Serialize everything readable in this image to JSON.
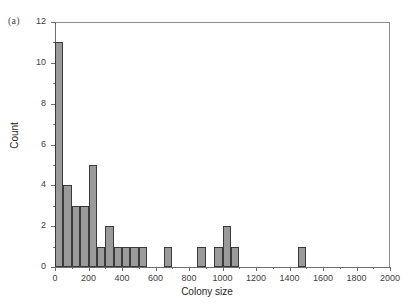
{
  "figure": {
    "panel_label": "(a)"
  },
  "chart_data": {
    "type": "bar",
    "title": "",
    "subtitle": "",
    "xlabel": "Colony size",
    "ylabel": "Count",
    "xlim": [
      0,
      2000
    ],
    "ylim": [
      0,
      12
    ],
    "bin_width": 50,
    "grid": false,
    "legend": null,
    "bar_color": "#9a9a9a",
    "bar_edge_color": "#3a3a3a",
    "x_major_ticks": [
      0,
      200,
      400,
      600,
      800,
      1000,
      1200,
      1400,
      1600,
      1800,
      2000
    ],
    "x_minor_ticks": [
      100,
      300,
      500,
      700,
      900,
      1100,
      1300,
      1500,
      1700,
      1900
    ],
    "x_tick_labels": [
      "0",
      "200",
      "400",
      "600",
      "800",
      "1000",
      "1200",
      "1400",
      "1600",
      "1800",
      "2000"
    ],
    "y_major_ticks": [
      0,
      2,
      4,
      6,
      8,
      10,
      12
    ],
    "y_minor_ticks": [
      1,
      3,
      5,
      7,
      9,
      11
    ],
    "y_tick_labels": [
      "0",
      "2",
      "4",
      "6",
      "8",
      "10",
      "12"
    ],
    "bins": [
      {
        "x0": 0,
        "x1": 50,
        "count": 11
      },
      {
        "x0": 50,
        "x1": 100,
        "count": 4
      },
      {
        "x0": 100,
        "x1": 150,
        "count": 3
      },
      {
        "x0": 150,
        "x1": 200,
        "count": 3
      },
      {
        "x0": 200,
        "x1": 250,
        "count": 5
      },
      {
        "x0": 250,
        "x1": 300,
        "count": 1
      },
      {
        "x0": 300,
        "x1": 350,
        "count": 2
      },
      {
        "x0": 350,
        "x1": 400,
        "count": 1
      },
      {
        "x0": 400,
        "x1": 450,
        "count": 1
      },
      {
        "x0": 450,
        "x1": 500,
        "count": 1
      },
      {
        "x0": 500,
        "x1": 550,
        "count": 1
      },
      {
        "x0": 650,
        "x1": 700,
        "count": 1
      },
      {
        "x0": 850,
        "x1": 900,
        "count": 1
      },
      {
        "x0": 950,
        "x1": 1000,
        "count": 1
      },
      {
        "x0": 1000,
        "x1": 1050,
        "count": 2
      },
      {
        "x0": 1050,
        "x1": 1100,
        "count": 1
      },
      {
        "x0": 1450,
        "x1": 1500,
        "count": 1
      }
    ]
  }
}
